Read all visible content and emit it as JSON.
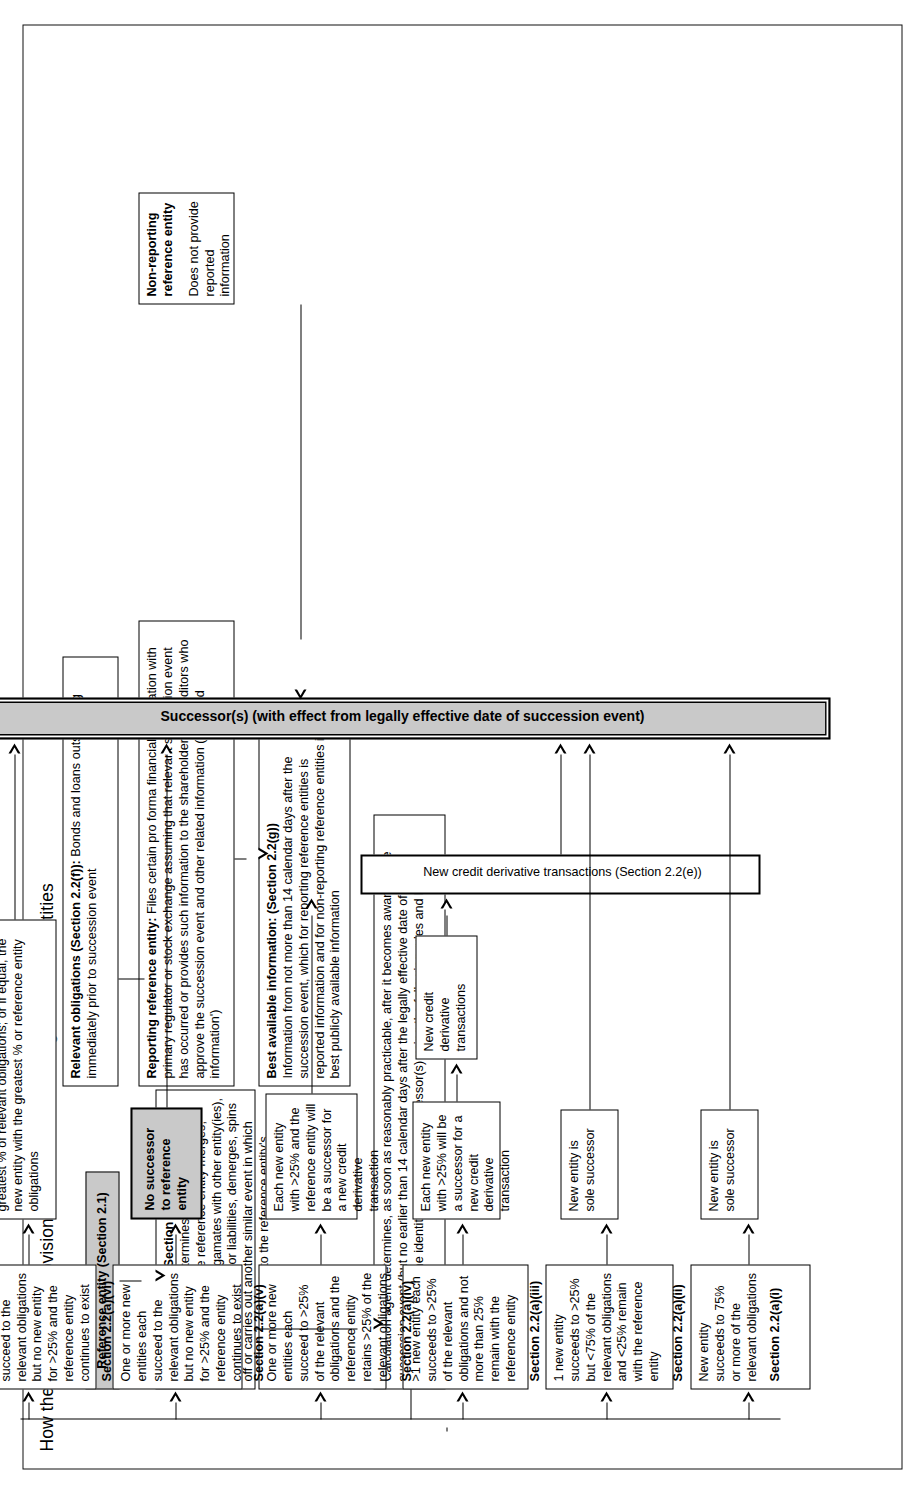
{
  "title": "How the succession provisions work for non-sovereign reference entities",
  "boxes": {
    "reference_entity": "Reference entity (Section 2.1)",
    "relevant_obligations": {
      "heading": "Relevant obligations (Section 2.2(f)):",
      "body": "Bonds and loans outstanding immediately prior to succession event"
    },
    "succession_event": {
      "heading": "Succession event (Section 2.2(b))",
      "body": "Calculation agent determines that excluding non-M&A style events, the reference entity merges, consolidates or amalgamates with other entity(ies), or transfer its assets or liabilities, demerges, spins off or carries out another similar event in which one entity succeeds to the reference entity's relevant obligations"
    },
    "reporting_reference_entity": {
      "heading": "Reporting reference entity:",
      "body": "Files certain pro forma financial information with primary regulator or stock exchange assuming that relevant succession event has occurred or provides such information to the shareholders or creditors who approve the succession event and other related information ('reported information')",
      "italic_1": "pro forma"
    },
    "best_available_information": {
      "heading": "Best available information: (Section 2.2(g))",
      "body": "Information from not more than 14 calendar days after the succession event, which for reporting reference entities is reported information and for non-reporting reference entities is best publicly available information"
    },
    "non_reporting_reference_entity": {
      "heading": "Non-reporting reference entity",
      "body": "Does not provide reported information"
    },
    "calculation_agent_determines": "Calculation agent determines, as soon as reasonably practicable, after it becomes aware of the succession event (but no earlier than 14 calendar days after the legally effective date of the succession event), the identity (if any) of the successor(s) using the following rules and best available information",
    "rule_i": {
      "body": "New entity succeeds to 75% or more of the relevant obligations",
      "section": "Section 2.2(a)(i)"
    },
    "rule_ii": {
      "body": "1 new entity succeeds to >25% but <75% of the relevant obligations and <25% remain with the reference entity",
      "section": "Section 2.2(a)(ii)"
    },
    "rule_iii": {
      "body": ">1 new entity each succeeds to >25% of the relevant obligations and not more than 25% remain with the reference entity",
      "section": "Section 2.2(a)(iii)"
    },
    "rule_iv": {
      "body": "One or more new entities each succeed to >25% of the relevant obligations and the reference entity retains >25% of the relevant obligations",
      "section": "Section 2.2(a)(iv)"
    },
    "rule_v": {
      "body": "One or more new entities each succeed to the relevant obligations but no new entity for >25% and the reference entity continues to exist",
      "section": "Section 2.2(a)(v)"
    },
    "rule_vi": {
      "body": "One or more new entities each succeed to the relevant obligations but no new entity for >25% and the reference entity continues to exist",
      "section": "Section 2.2(a)(vi)"
    },
    "outcome_i": "New entity is sole successor",
    "outcome_ii": "New entity is sole successor",
    "outcome_iii": "Each new entity with >25% will be a successor for a new credit derivative transaction",
    "outcome_iv": "Each new entity with >25% and the reference entity will be a successor for a new credit derivative transaction",
    "outcome_v": "No successor to reference entity",
    "outcome_vi": "Successor is new entity which succeeds to greatest % of relevant obligations; or if equal, the new entity with the greatest % or reference entity obligations",
    "new_credit_derivative_transactions_small": "New credit derivative transactions",
    "new_credit_derivative_transactions": "New credit derivative transactions (Section 2.2(e))",
    "successors": "Successor(s) (with effect from legally effective date of succession event)"
  },
  "colors": {
    "gray_fill": "#c9c9c9",
    "line": "#000000",
    "background": "#ffffff"
  }
}
